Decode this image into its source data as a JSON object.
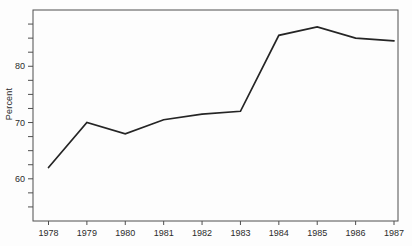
{
  "figure": {
    "background": "#fdfdfd"
  },
  "chart_data": {
    "type": "line",
    "x": [
      "1978",
      "1979",
      "1980",
      "1981",
      "1982",
      "1983",
      "1984",
      "1985",
      "1986",
      "1987"
    ],
    "values": [
      62,
      70,
      68,
      70.5,
      71.5,
      72,
      85.5,
      87,
      85,
      84.5
    ],
    "title": "",
    "xlabel": "",
    "ylabel": "Percent",
    "ylim": [
      52.5,
      90
    ],
    "yticks_labeled": [
      60,
      70,
      80
    ],
    "ytick_minor_step": 2.5,
    "ytick_minor_range": [
      55,
      87.5
    ],
    "grid": false,
    "legend": "none",
    "frame": "box",
    "line_color": "#252525",
    "axis_color": "#4f4f4f",
    "text_color": "#2b2b2b"
  }
}
